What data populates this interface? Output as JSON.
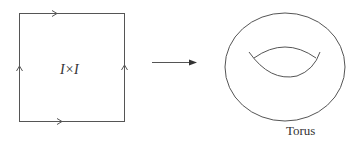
{
  "square": {
    "label": "I×I"
  },
  "map_arrow": {
    "direction": "right"
  },
  "torus": {
    "label": "Torus"
  },
  "colors": {
    "stroke": "#444444",
    "background": "#ffffff"
  }
}
